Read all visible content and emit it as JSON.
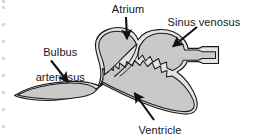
{
  "figure": {
    "kind": "anatomical-diagram",
    "width": 255,
    "height": 140,
    "background_color": "#ffffff",
    "outline_color": "#1a1a1a",
    "chamber_fill_color": "#c9c9c9",
    "wall_fill_color": "#e2e2e2",
    "arrow_color": "#111111",
    "text_color": "#161616"
  },
  "labels": {
    "atrium": "Atrium",
    "sinus_venosus": "Sinus venosus",
    "bulbus_arteriosus_line1": "Bulbus",
    "bulbus_arteriosus_line2": "arteriosus",
    "ventricle": "Ventricle"
  },
  "callouts": [
    {
      "name": "atrium",
      "label": "Atrium",
      "direction": "down",
      "from": [
        126,
        17
      ],
      "to": [
        127,
        41
      ]
    },
    {
      "name": "sinus-venosus",
      "label": "Sinus venosus",
      "direction": "down-left",
      "from": [
        196,
        28
      ],
      "to": [
        171,
        48
      ]
    },
    {
      "name": "bulbus-arteriosus",
      "label": "Bulbus arteriosus",
      "direction": "down-right",
      "from": [
        51,
        61
      ],
      "to": [
        69,
        84
      ]
    },
    {
      "name": "ventricle",
      "label": "Ventricle",
      "direction": "up-left",
      "from": [
        153,
        119
      ],
      "to": [
        133,
        91
      ]
    }
  ],
  "structures": [
    {
      "name": "bulbus-arteriosus",
      "description": "leaf shaped chamber at lower left with narrow outflow tube extending to the far left"
    },
    {
      "name": "ventricle",
      "description": "large lower chamber with trabeculated jagged inner wall"
    },
    {
      "name": "atrium",
      "description": "upper left lobed chamber"
    },
    {
      "name": "sinus-venosus",
      "description": "upper right chamber narrowing to an inflow tube at the far right"
    }
  ],
  "edge_marks": {
    "present": true,
    "count": 8,
    "color": "#d8d8d8"
  }
}
